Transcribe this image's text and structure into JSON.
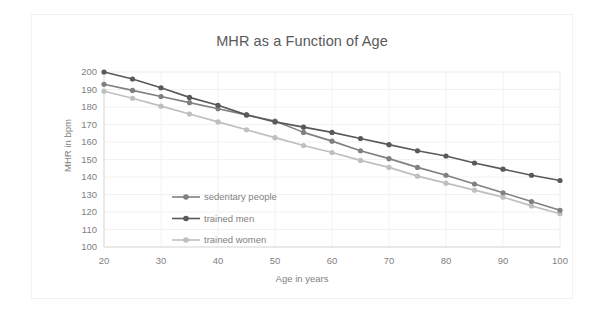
{
  "chart_data": {
    "type": "line",
    "title": "MHR as a Function of Age",
    "xlabel": "Age in years",
    "ylabel": "MHR in bpm",
    "x": [
      20,
      25,
      30,
      35,
      40,
      45,
      50,
      55,
      60,
      65,
      70,
      75,
      80,
      85,
      90,
      95,
      100
    ],
    "xlim": [
      20,
      100
    ],
    "ylim": [
      100,
      200
    ],
    "xticks": [
      20,
      30,
      40,
      50,
      60,
      70,
      80,
      90,
      100
    ],
    "yticks": [
      100,
      110,
      120,
      130,
      140,
      150,
      160,
      170,
      180,
      190,
      200
    ],
    "grid": true,
    "legend_position": "inside-left",
    "series": [
      {
        "name": "sedentary people",
        "color": "#808080",
        "values": [
          193.0,
          189.5,
          186.0,
          182.5,
          179.0,
          175.5,
          172.0,
          165.5,
          160.5,
          155.0,
          150.5,
          145.5,
          141.0,
          136.0,
          131.0,
          126.0,
          121.0
        ]
      },
      {
        "name": "trained men",
        "color": "#595959",
        "values": [
          200.0,
          196.0,
          191.0,
          185.5,
          181.0,
          175.5,
          171.5,
          168.5,
          165.5,
          162.0,
          158.5,
          155.0,
          152.0,
          148.0,
          144.5,
          141.0,
          138.0
        ]
      },
      {
        "name": "trained women",
        "color": "#bfbfbf",
        "values": [
          189.0,
          185.0,
          180.5,
          176.0,
          171.5,
          167.0,
          162.5,
          158.0,
          154.0,
          149.5,
          145.5,
          140.5,
          136.5,
          132.5,
          128.5,
          123.5,
          119.0
        ]
      }
    ]
  },
  "legend": {
    "items": [
      {
        "label": "sedentary people"
      },
      {
        "label": "trained men"
      },
      {
        "label": "trained women"
      }
    ]
  },
  "colors": {
    "sedentary": "#808080",
    "trained_men": "#595959",
    "trained_women": "#bfbfbf",
    "grid": "#f2f2f2",
    "axis": "#d9d9d9",
    "text": "#7f7f7f",
    "title_text": "#595959",
    "background": "#ffffff"
  }
}
